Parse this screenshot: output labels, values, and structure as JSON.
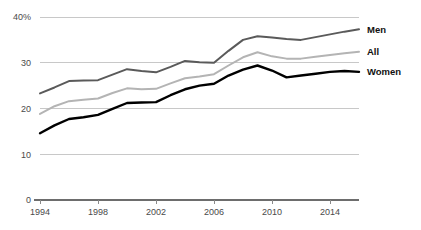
{
  "chart_data": {
    "type": "line",
    "title": "",
    "subtitle": "",
    "xlabel": "",
    "ylabel": "",
    "grid": true,
    "legend_position": "right-end-of-line",
    "x": [
      1994,
      1995,
      1996,
      1997,
      1998,
      1999,
      2000,
      2001,
      2002,
      2003,
      2004,
      2005,
      2006,
      2007,
      2008,
      2009,
      2010,
      2011,
      2012,
      2013,
      2014,
      2015,
      2016
    ],
    "xlim": [
      1994,
      2016
    ],
    "ylim": [
      0,
      40
    ],
    "yticks": [
      0,
      10,
      20,
      30,
      40
    ],
    "ytick_labels": [
      "0",
      "10",
      "20",
      "30",
      "40%"
    ],
    "xticks": [
      1994,
      1998,
      2002,
      2006,
      2010,
      2014
    ],
    "xtick_labels": [
      "1994",
      "1998",
      "2002",
      "2006",
      "2010",
      "2014"
    ],
    "series": [
      {
        "name": "Men",
        "color": "#5a5a5a",
        "width": 2.0,
        "values": [
          23.3,
          24.6,
          26.0,
          26.1,
          26.2,
          27.4,
          28.6,
          28.2,
          27.9,
          29.1,
          30.4,
          30.1,
          30.0,
          32.6,
          35.0,
          35.8,
          35.5,
          35.2,
          35.0,
          35.6,
          36.2,
          36.8,
          37.3
        ]
      },
      {
        "name": "All",
        "color": "#b4b4b4",
        "width": 2.0,
        "values": [
          18.8,
          20.5,
          21.6,
          21.9,
          22.2,
          23.4,
          24.4,
          24.2,
          24.3,
          25.5,
          26.6,
          27.0,
          27.5,
          29.4,
          31.2,
          32.3,
          31.4,
          30.9,
          30.9,
          31.3,
          31.7,
          32.1,
          32.4
        ]
      },
      {
        "name": "Women",
        "color": "#000000",
        "width": 2.4,
        "values": [
          14.6,
          16.3,
          17.7,
          18.1,
          18.6,
          19.9,
          21.2,
          21.3,
          21.4,
          22.9,
          24.2,
          25.0,
          25.4,
          27.2,
          28.5,
          29.4,
          28.3,
          26.8,
          27.2,
          27.6,
          28.0,
          28.2,
          28.0
        ]
      }
    ],
    "legend_labels": [
      "Men",
      "All",
      "Women"
    ]
  },
  "colors": {
    "background": "#ffffff",
    "gridline": "#c8c8c8",
    "axis": "#6d6d6d",
    "tick_text": "#4a4a4a",
    "legend_text": "#111111",
    "men": "#5a5a5a",
    "all": "#b4b4b4",
    "women": "#000000"
  }
}
